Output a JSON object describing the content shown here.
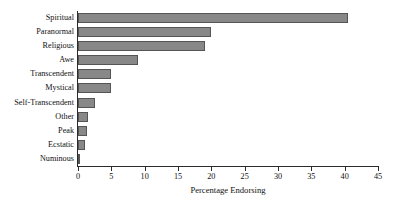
{
  "chart_data": {
    "type": "bar",
    "orientation": "horizontal",
    "title": "",
    "xlabel": "Percentage Endorsing",
    "ylabel": "",
    "xlim": [
      0,
      45
    ],
    "xticks": [
      0,
      5,
      10,
      15,
      20,
      25,
      30,
      35,
      40,
      45
    ],
    "grid": false,
    "legend": null,
    "bar_color": "#888888",
    "bar_edge_color": "#555555",
    "axis_color": "#2b2b2b",
    "categories": [
      "Spiritual",
      "Paranormal",
      "Religious",
      "Awe",
      "Transcendent",
      "Mystical",
      "Self-Transcendent",
      "Other",
      "Peak",
      "Ecstatic",
      "Numinous"
    ],
    "values": [
      40.5,
      20.0,
      19.0,
      9.0,
      5.0,
      5.0,
      2.5,
      1.5,
      1.3,
      1.1,
      0.3
    ]
  }
}
